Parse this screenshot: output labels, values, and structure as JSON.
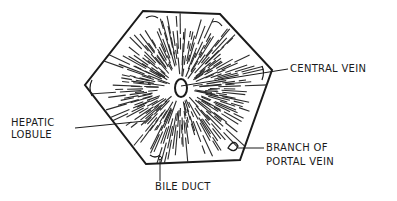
{
  "diagram": {
    "labels": {
      "central_vein": "CENTRAL VEIN",
      "hepatic_lobule_line1": "HEPATIC",
      "hepatic_lobule_line2": "LOBULE",
      "branch_line1": "BRANCH OF",
      "branch_line2": "PORTAL VEIN",
      "bile_duct": "BILE DUCT"
    },
    "colors": {
      "ink": "#1a1a1a",
      "paper": "#ffffff"
    }
  }
}
